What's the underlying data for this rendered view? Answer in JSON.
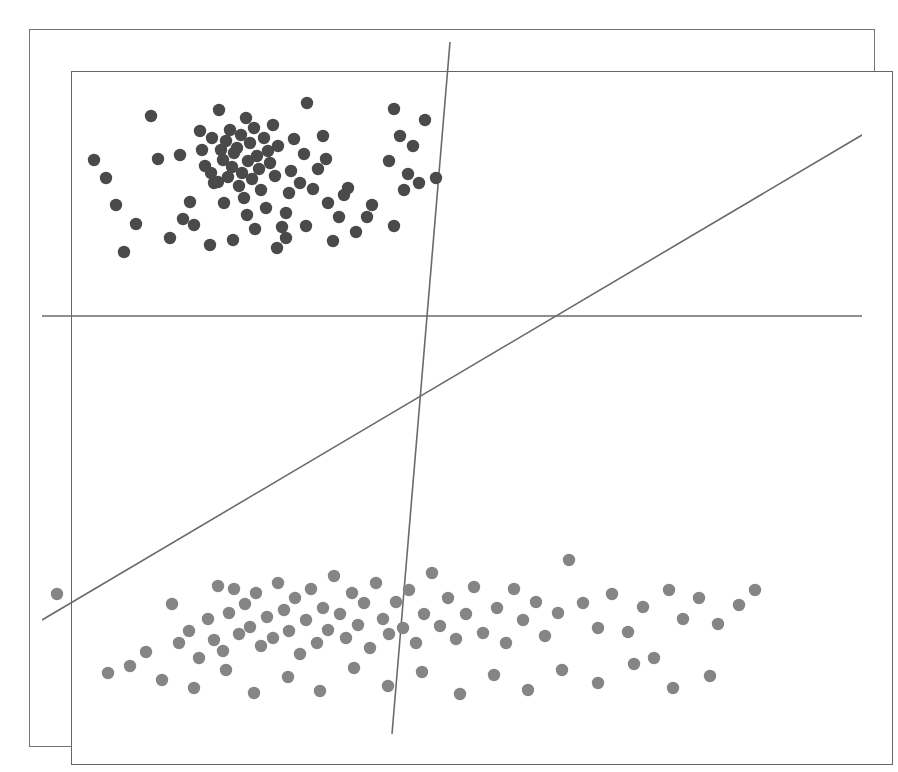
{
  "figure": {
    "title_sliver": "",
    "background_color": "#ffffff",
    "frame": {
      "outer_color": "#737373",
      "inner_color": "#656565"
    }
  },
  "chart_data": {
    "type": "scatter",
    "title": "",
    "subtitle": "",
    "xlabel": "",
    "ylabel": "",
    "xlim": [
      0,
      820
    ],
    "ylim": [
      0,
      692
    ],
    "grid": false,
    "legend": "none",
    "axis_ticks": "none",
    "point_radius": 6.2,
    "series": [
      {
        "name": "class-a-dark",
        "color": "#4a4a4a",
        "marker": "filled-circle",
        "points": [
          [
            109,
            74
          ],
          [
            116,
            117
          ],
          [
            138,
            113
          ],
          [
            148,
            160
          ],
          [
            152,
            183
          ],
          [
            158,
            89
          ],
          [
            160,
            108
          ],
          [
            163,
            124
          ],
          [
            169,
            131
          ],
          [
            170,
            96
          ],
          [
            176,
            140
          ],
          [
            177,
            68
          ],
          [
            179,
            108
          ],
          [
            181,
            118
          ],
          [
            182,
            161
          ],
          [
            184,
            99
          ],
          [
            186,
            135
          ],
          [
            188,
            88
          ],
          [
            190,
            125
          ],
          [
            192,
            111
          ],
          [
            195,
            106
          ],
          [
            197,
            144
          ],
          [
            199,
            93
          ],
          [
            200,
            131
          ],
          [
            202,
            156
          ],
          [
            204,
            76
          ],
          [
            206,
            119
          ],
          [
            208,
            101
          ],
          [
            210,
            137
          ],
          [
            212,
            86
          ],
          [
            215,
            114
          ],
          [
            217,
            127
          ],
          [
            219,
            148
          ],
          [
            222,
            96
          ],
          [
            224,
            166
          ],
          [
            226,
            109
          ],
          [
            228,
            121
          ],
          [
            231,
            83
          ],
          [
            233,
            134
          ],
          [
            236,
            104
          ],
          [
            240,
            185
          ],
          [
            244,
            171
          ],
          [
            247,
            151
          ],
          [
            249,
            129
          ],
          [
            252,
            97
          ],
          [
            258,
            141
          ],
          [
            262,
            112
          ],
          [
            265,
            61
          ],
          [
            271,
            147
          ],
          [
            276,
            127
          ],
          [
            281,
            94
          ],
          [
            284,
            117
          ],
          [
            297,
            175
          ],
          [
            302,
            153
          ],
          [
            314,
            190
          ],
          [
            325,
            175
          ],
          [
            347,
            119
          ],
          [
            352,
            67
          ],
          [
            358,
            94
          ],
          [
            362,
            148
          ],
          [
            366,
            132
          ],
          [
            371,
            104
          ],
          [
            377,
            141
          ],
          [
            383,
            78
          ],
          [
            394,
            136
          ],
          [
            52,
            118
          ],
          [
            64,
            136
          ],
          [
            74,
            163
          ],
          [
            94,
            182
          ],
          [
            82,
            210
          ],
          [
            128,
            196
          ],
          [
            141,
            177
          ],
          [
            168,
            203
          ],
          [
            172,
            141
          ],
          [
            191,
            198
          ],
          [
            205,
            173
          ],
          [
            213,
            187
          ],
          [
            235,
            206
          ],
          [
            244,
            196
          ],
          [
            264,
            184
          ],
          [
            286,
            161
          ],
          [
            291,
            199
          ],
          [
            306,
            146
          ],
          [
            330,
            163
          ],
          [
            352,
            184
          ]
        ]
      },
      {
        "name": "class-b-light",
        "color": "#858585",
        "marker": "filled-circle",
        "points": [
          [
            15,
            552
          ],
          [
            130,
            562
          ],
          [
            137,
            601
          ],
          [
            147,
            589
          ],
          [
            157,
            616
          ],
          [
            166,
            577
          ],
          [
            172,
            598
          ],
          [
            176,
            544
          ],
          [
            181,
            609
          ],
          [
            187,
            571
          ],
          [
            192,
            547
          ],
          [
            197,
            592
          ],
          [
            203,
            562
          ],
          [
            208,
            585
          ],
          [
            214,
            551
          ],
          [
            219,
            604
          ],
          [
            225,
            575
          ],
          [
            231,
            596
          ],
          [
            236,
            541
          ],
          [
            242,
            568
          ],
          [
            247,
            589
          ],
          [
            253,
            556
          ],
          [
            258,
            612
          ],
          [
            264,
            578
          ],
          [
            269,
            547
          ],
          [
            275,
            601
          ],
          [
            281,
            566
          ],
          [
            286,
            588
          ],
          [
            292,
            534
          ],
          [
            298,
            572
          ],
          [
            304,
            596
          ],
          [
            310,
            551
          ],
          [
            316,
            583
          ],
          [
            322,
            561
          ],
          [
            328,
            606
          ],
          [
            334,
            541
          ],
          [
            341,
            577
          ],
          [
            347,
            592
          ],
          [
            354,
            560
          ],
          [
            361,
            586
          ],
          [
            367,
            548
          ],
          [
            374,
            601
          ],
          [
            382,
            572
          ],
          [
            390,
            531
          ],
          [
            398,
            584
          ],
          [
            406,
            556
          ],
          [
            414,
            597
          ],
          [
            424,
            572
          ],
          [
            432,
            545
          ],
          [
            441,
            591
          ],
          [
            455,
            566
          ],
          [
            464,
            601
          ],
          [
            472,
            547
          ],
          [
            481,
            578
          ],
          [
            494,
            560
          ],
          [
            503,
            594
          ],
          [
            516,
            571
          ],
          [
            527,
            518
          ],
          [
            541,
            561
          ],
          [
            556,
            586
          ],
          [
            570,
            552
          ],
          [
            586,
            590
          ],
          [
            601,
            565
          ],
          [
            612,
            616
          ],
          [
            627,
            548
          ],
          [
            641,
            577
          ],
          [
            657,
            556
          ],
          [
            676,
            582
          ],
          [
            697,
            563
          ],
          [
            713,
            548
          ],
          [
            66,
            631
          ],
          [
            88,
            624
          ],
          [
            104,
            610
          ],
          [
            120,
            638
          ],
          [
            152,
            646
          ],
          [
            184,
            628
          ],
          [
            212,
            651
          ],
          [
            246,
            635
          ],
          [
            278,
            649
          ],
          [
            312,
            626
          ],
          [
            346,
            644
          ],
          [
            380,
            630
          ],
          [
            418,
            652
          ],
          [
            452,
            633
          ],
          [
            486,
            648
          ],
          [
            520,
            628
          ],
          [
            556,
            641
          ],
          [
            592,
            622
          ],
          [
            631,
            646
          ],
          [
            668,
            634
          ]
        ]
      }
    ],
    "decision_boundaries": [
      {
        "name": "horizontal-separator",
        "x1": 0,
        "y1": 274,
        "x2": 820,
        "y2": 274,
        "color": "#6a6a6a"
      },
      {
        "name": "near-vertical-separator",
        "x1": 408,
        "y1": 0,
        "x2": 350,
        "y2": 692,
        "color": "#6a6a6a"
      },
      {
        "name": "diagonal-separator",
        "x1": 0,
        "y1": 578,
        "x2": 820,
        "y2": 93,
        "color": "#6a6a6a"
      }
    ]
  }
}
